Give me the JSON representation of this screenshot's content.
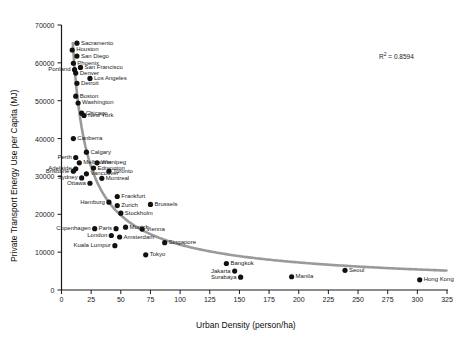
{
  "chart_data": {
    "type": "scatter",
    "title": "",
    "xlabel": "Urban Density (person/ha)",
    "ylabel": "Private Transport Energy Use per Capita (MJ)",
    "xlim": [
      0,
      325
    ],
    "ylim": [
      0,
      70000
    ],
    "xticks": [
      0,
      25,
      50,
      75,
      100,
      125,
      150,
      175,
      200,
      225,
      250,
      275,
      300,
      325
    ],
    "yticks": [
      0,
      10000,
      20000,
      30000,
      40000,
      50000,
      60000,
      70000
    ],
    "grid": false,
    "legend": null,
    "annotations": [
      {
        "text": "R² = 0.8594",
        "x": 260,
        "y": 62000
      }
    ],
    "trendline": {
      "type": "power",
      "color": "#9a9a9a",
      "r_squared": 0.8594
    },
    "marker_color": "#111111",
    "points": [
      {
        "label": "Sacramento",
        "x": 13,
        "y": 65200,
        "lab_pos": "right"
      },
      {
        "label": "Houston",
        "x": 9,
        "y": 63400,
        "lab_pos": "right"
      },
      {
        "label": "San Diego",
        "x": 13,
        "y": 61800,
        "lab_pos": "right"
      },
      {
        "label": "Phoenix",
        "x": 10,
        "y": 59900,
        "lab_pos": "right"
      },
      {
        "label": "San Francisco",
        "x": 16,
        "y": 58800,
        "lab_pos": "right"
      },
      {
        "label": "Portland",
        "x": 11,
        "y": 58200,
        "lab_pos": "left"
      },
      {
        "label": "Denver",
        "x": 12,
        "y": 57300,
        "lab_pos": "right"
      },
      {
        "label": "Los Angeles",
        "x": 24,
        "y": 55900,
        "lab_pos": "right"
      },
      {
        "label": "Detroit",
        "x": 13,
        "y": 54600,
        "lab_pos": "right"
      },
      {
        "label": "Boston",
        "x": 12,
        "y": 51200,
        "lab_pos": "right"
      },
      {
        "label": "Washington",
        "x": 14,
        "y": 49400,
        "lab_pos": "right"
      },
      {
        "label": "Chicago",
        "x": 17,
        "y": 46700,
        "lab_pos": "right"
      },
      {
        "label": "New York",
        "x": 19,
        "y": 46100,
        "lab_pos": "right"
      },
      {
        "label": "Canberra",
        "x": 10,
        "y": 40000,
        "lab_pos": "right"
      },
      {
        "label": "Calgary",
        "x": 21,
        "y": 36400,
        "lab_pos": "right"
      },
      {
        "label": "Perth",
        "x": 12,
        "y": 35000,
        "lab_pos": "left"
      },
      {
        "label": "Melbourne",
        "x": 15,
        "y": 33600,
        "lab_pos": "right"
      },
      {
        "label": "Winnipeg",
        "x": 30,
        "y": 33600,
        "lab_pos": "right"
      },
      {
        "label": "Adelaide",
        "x": 12,
        "y": 32000,
        "lab_pos": "left"
      },
      {
        "label": "Brisbane",
        "x": 10,
        "y": 31400,
        "lab_pos": "left"
      },
      {
        "label": "Edmonton",
        "x": 27,
        "y": 32200,
        "lab_pos": "right"
      },
      {
        "label": "Toronto",
        "x": 40,
        "y": 31400,
        "lab_pos": "right"
      },
      {
        "label": "Vancouver",
        "x": 21,
        "y": 30700,
        "lab_pos": "right"
      },
      {
        "label": "Sydney",
        "x": 17,
        "y": 29600,
        "lab_pos": "left"
      },
      {
        "label": "Montreal",
        "x": 34,
        "y": 29500,
        "lab_pos": "right"
      },
      {
        "label": "Ottawa",
        "x": 24,
        "y": 28200,
        "lab_pos": "left"
      },
      {
        "label": "Frankfurt",
        "x": 47,
        "y": 24700,
        "lab_pos": "right"
      },
      {
        "label": "Hamburg",
        "x": 40,
        "y": 23200,
        "lab_pos": "left"
      },
      {
        "label": "Zurich",
        "x": 47,
        "y": 22300,
        "lab_pos": "right"
      },
      {
        "label": "Brussels",
        "x": 75,
        "y": 22600,
        "lab_pos": "right"
      },
      {
        "label": "Stockholm",
        "x": 50,
        "y": 20300,
        "lab_pos": "right"
      },
      {
        "label": "Paris",
        "x": 46,
        "y": 16200,
        "lab_pos": "left"
      },
      {
        "label": "Munich",
        "x": 54,
        "y": 16600,
        "lab_pos": "right"
      },
      {
        "label": "Vienna",
        "x": 68,
        "y": 16100,
        "lab_pos": "right"
      },
      {
        "label": "Copenhagen",
        "x": 28,
        "y": 16200,
        "lab_pos": "left"
      },
      {
        "label": "London",
        "x": 42,
        "y": 14400,
        "lab_pos": "left"
      },
      {
        "label": "Amsterdam",
        "x": 49,
        "y": 14000,
        "lab_pos": "right"
      },
      {
        "label": "Singapore",
        "x": 87,
        "y": 12500,
        "lab_pos": "right"
      },
      {
        "label": "Kuala Lumpur",
        "x": 45,
        "y": 11700,
        "lab_pos": "left"
      },
      {
        "label": "Tokyo",
        "x": 71,
        "y": 9300,
        "lab_pos": "right"
      },
      {
        "label": "Bangkok",
        "x": 139,
        "y": 7000,
        "lab_pos": "right"
      },
      {
        "label": "Jakarta",
        "x": 146,
        "y": 5000,
        "lab_pos": "left"
      },
      {
        "label": "Surabaya",
        "x": 151,
        "y": 3400,
        "lab_pos": "left"
      },
      {
        "label": "Manila",
        "x": 194,
        "y": 3500,
        "lab_pos": "right"
      },
      {
        "label": "Seoul",
        "x": 239,
        "y": 5200,
        "lab_pos": "right"
      },
      {
        "label": "Hong Kong",
        "x": 302,
        "y": 2700,
        "lab_pos": "right"
      }
    ]
  }
}
